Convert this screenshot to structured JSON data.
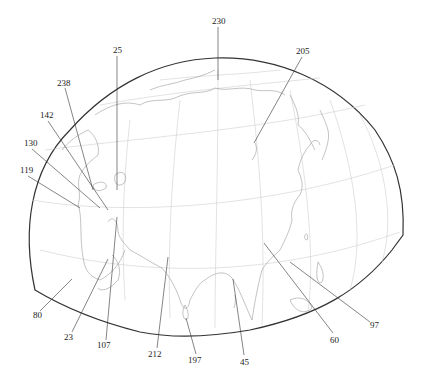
{
  "map": {
    "type": "orthographic-globe-section",
    "region": "Eurasia / Asia",
    "colors": {
      "background": "#ffffff",
      "outline": "#333333",
      "graticule": "#cfcfcf",
      "coastline": "#9a9a9a",
      "leader": "#333333",
      "label": "#222222"
    },
    "labels": [
      {
        "id": "230",
        "text": "230",
        "x": 218,
        "y": 24,
        "tx": 218,
        "ty": 80
      },
      {
        "id": "205",
        "text": "205",
        "x": 301,
        "y": 54,
        "tx": 254,
        "ty": 143
      },
      {
        "id": "25",
        "text": "25",
        "x": 117,
        "y": 53,
        "tx": 117,
        "ty": 190
      },
      {
        "id": "238",
        "text": "238",
        "x": 63,
        "y": 86,
        "tx": 93,
        "ty": 190
      },
      {
        "id": "142",
        "text": "142",
        "x": 46,
        "y": 118,
        "tx": 108,
        "ty": 210
      },
      {
        "id": "130",
        "text": "130",
        "x": 30,
        "y": 146,
        "tx": 100,
        "ty": 208
      },
      {
        "id": "119",
        "text": "119",
        "x": 26,
        "y": 173,
        "tx": 80,
        "ty": 208
      },
      {
        "id": "80",
        "text": "80",
        "x": 37,
        "y": 315,
        "tx": 72,
        "ty": 279
      },
      {
        "id": "23",
        "text": "23",
        "x": 68,
        "y": 337,
        "tx": 108,
        "ty": 259
      },
      {
        "id": "107",
        "text": "107",
        "x": 103,
        "y": 345,
        "tx": 117,
        "ty": 217
      },
      {
        "id": "212",
        "text": "212",
        "x": 154,
        "y": 354,
        "tx": 168,
        "ty": 257
      },
      {
        "id": "197",
        "text": "197",
        "x": 194,
        "y": 360,
        "tx": 186,
        "ty": 318
      },
      {
        "id": "45",
        "text": "45",
        "x": 246,
        "y": 362,
        "tx": 233,
        "ty": 279
      },
      {
        "id": "60",
        "text": "60",
        "x": 334,
        "y": 340,
        "tx": 264,
        "ty": 243
      },
      {
        "id": "97",
        "text": "97",
        "x": 374,
        "y": 326,
        "tx": 290,
        "ty": 262
      }
    ]
  }
}
